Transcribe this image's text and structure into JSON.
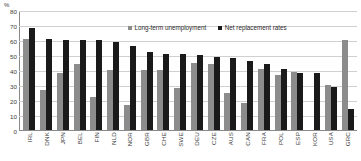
{
  "chart_data": {
    "type": "bar",
    "title": "",
    "xlabel": "",
    "ylabel": "%",
    "ylim": [
      0,
      80
    ],
    "yticks": [
      0,
      10,
      20,
      30,
      40,
      50,
      60,
      70,
      80
    ],
    "grid": true,
    "legend_position": "top-center",
    "categories": [
      "IRL",
      "DNK",
      "JPN",
      "BEL",
      "FIN",
      "NLD",
      "NOR",
      "GBR",
      "CHE",
      "SWE",
      "DEU",
      "CZE",
      "AUS",
      "CAN",
      "FRA",
      "POL",
      "ESP",
      "KOR",
      "USA",
      "GRC"
    ],
    "series": [
      {
        "name": "Long-term unemployment",
        "color": "#8c8c8c",
        "values": [
          61,
          27,
          38,
          44,
          22,
          40,
          17,
          40,
          40,
          28,
          45,
          44,
          25,
          18,
          41,
          37,
          39,
          0,
          30,
          60
        ]
      },
      {
        "name": "Net replacement rates",
        "color": "#1a1a1a",
        "values": [
          68,
          61,
          60,
          60,
          60,
          59,
          56,
          52,
          51,
          51,
          50,
          49,
          48,
          46,
          44,
          41,
          38,
          38,
          29,
          14
        ]
      }
    ]
  },
  "axis": {
    "unit_label": "%",
    "tick_labels": [
      "80",
      "70",
      "60",
      "50",
      "40",
      "30",
      "20",
      "10",
      "0"
    ]
  },
  "legend": {
    "items": [
      {
        "label": "Long-term unemployment",
        "key": "lt"
      },
      {
        "label": "Net replacement rates",
        "key": "nr"
      }
    ]
  },
  "colors": {
    "long_term_unemployment": "#8c8c8c",
    "net_replacement_rates": "#1a1a1a",
    "gridline": "#d0d0d0",
    "axis": "#8a8a8a",
    "text": "#3a3a3a",
    "background": "#ffffff"
  }
}
